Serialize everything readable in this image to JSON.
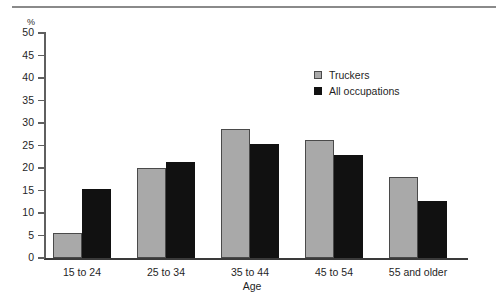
{
  "chart_data": {
    "type": "bar",
    "title": "",
    "subtitle": "",
    "xlabel": "Age",
    "ylabel": "%",
    "ylim": [
      0,
      50
    ],
    "yticks": [
      0,
      5,
      10,
      15,
      20,
      25,
      30,
      35,
      40,
      45,
      50
    ],
    "grid": false,
    "legend_position": "upper-right-inside",
    "categories": [
      "15 to  24",
      "25 to 34",
      "35 to 44",
      "45 to 54",
      "55 and older"
    ],
    "series": [
      {
        "name": "Truckers",
        "color": "#a9a9a9",
        "values": [
          5.5,
          20.0,
          28.7,
          26.2,
          18.0
        ]
      },
      {
        "name": "All occupations",
        "color": "#111111",
        "values": [
          15.4,
          21.3,
          25.4,
          23.0,
          12.6
        ]
      }
    ]
  },
  "axes": {
    "y_unit_label": "%",
    "x_axis_title": "Age",
    "y_tick_labels": [
      "50",
      "45",
      "40",
      "35",
      "30",
      "25",
      "20",
      "15",
      "10",
      "5",
      "0"
    ]
  },
  "legend": {
    "items": [
      {
        "label": "Truckers",
        "swatch": "gray-swatch-icon"
      },
      {
        "label": "All occupations",
        "swatch": "black-swatch-icon"
      }
    ]
  }
}
